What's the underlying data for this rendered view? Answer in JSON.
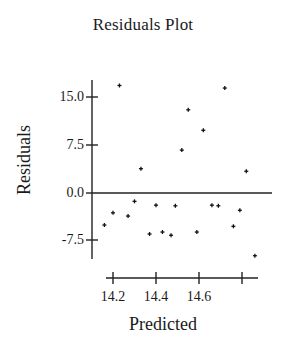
{
  "chart_data": {
    "type": "scatter",
    "title": "Residuals Plot",
    "xlabel": "Predicted",
    "ylabel": "Residuals",
    "x_ticks": [
      14.2,
      14.4,
      14.6,
      14.8
    ],
    "x_tick_labels": [
      "14.2",
      "14.4",
      "14.6",
      ""
    ],
    "y_ticks": [
      15.0,
      7.5,
      0.0,
      -7.5
    ],
    "y_tick_labels": [
      "15.0",
      "7.5",
      "0.0",
      "-7.5"
    ],
    "xlim": [
      14.17,
      14.87
    ],
    "ylim": [
      -10.3,
      17.6
    ],
    "reference_line": 0.0,
    "grid": false,
    "legend": null,
    "marker": "+",
    "points": [
      {
        "x": 14.16,
        "y": -5.0
      },
      {
        "x": 14.2,
        "y": -3.1
      },
      {
        "x": 14.23,
        "y": 16.8
      },
      {
        "x": 14.27,
        "y": -3.6
      },
      {
        "x": 14.3,
        "y": -1.3
      },
      {
        "x": 14.33,
        "y": 3.8
      },
      {
        "x": 14.37,
        "y": -6.4
      },
      {
        "x": 14.4,
        "y": -1.9
      },
      {
        "x": 14.43,
        "y": -6.1
      },
      {
        "x": 14.47,
        "y": -6.6
      },
      {
        "x": 14.49,
        "y": -2.0
      },
      {
        "x": 14.52,
        "y": 6.7
      },
      {
        "x": 14.55,
        "y": 13.0
      },
      {
        "x": 14.59,
        "y": -6.1
      },
      {
        "x": 14.62,
        "y": 9.8
      },
      {
        "x": 14.66,
        "y": -1.9
      },
      {
        "x": 14.69,
        "y": -2.0
      },
      {
        "x": 14.72,
        "y": 16.4
      },
      {
        "x": 14.76,
        "y": -5.2
      },
      {
        "x": 14.79,
        "y": -2.7
      },
      {
        "x": 14.82,
        "y": 3.4
      },
      {
        "x": 14.86,
        "y": -9.8
      }
    ]
  }
}
